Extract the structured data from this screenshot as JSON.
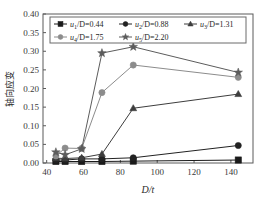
{
  "chart_data": {
    "type": "line",
    "title": "",
    "xlabel": "D/t",
    "ylabel": "轴向应变",
    "xlim": [
      38,
      152
    ],
    "ylim": [
      0.0,
      0.4
    ],
    "xticks": [
      40,
      60,
      80,
      100,
      120,
      140
    ],
    "yticks": [
      "0.00",
      "0.05",
      "0.10",
      "0.15",
      "0.20",
      "0.25",
      "0.30",
      "0.35",
      "0.40"
    ],
    "ytick_values": [
      0.0,
      0.05,
      0.1,
      0.15,
      0.2,
      0.25,
      0.3,
      0.35,
      0.4
    ],
    "grid": false,
    "legend_position": "top-inside",
    "x": [
      45,
      50,
      59,
      70,
      87,
      144
    ],
    "series": [
      {
        "name": "u1/D=0.44",
        "label_base": "u",
        "label_sub": "1",
        "label_rest": "/D=0.44",
        "marker": "square",
        "color": "#1a1a1a",
        "values": [
          0.004,
          0.004,
          0.004,
          0.004,
          0.005,
          0.008
        ]
      },
      {
        "name": "u2/D=0.88",
        "label_base": "u",
        "label_sub": "2",
        "label_rest": "/D=0.88",
        "marker": "circle",
        "color": "#222222",
        "values": [
          0.008,
          0.008,
          0.011,
          0.011,
          0.014,
          0.047
        ]
      },
      {
        "name": "u3/D=1.31",
        "label_base": "u",
        "label_sub": "3",
        "label_rest": "/D=1.31",
        "marker": "triangle",
        "color": "#3d3d3d",
        "values": [
          0.013,
          0.012,
          0.014,
          0.024,
          0.147,
          0.185
        ]
      },
      {
        "name": "u4/D=1.75",
        "label_base": "u",
        "label_sub": "4",
        "label_rest": "/D=1.75",
        "marker": "circle",
        "color": "#8c8c8c",
        "values": [
          0.019,
          0.04,
          0.039,
          0.189,
          0.263,
          0.23
        ]
      },
      {
        "name": "u5/D=2.20",
        "label_base": "u",
        "label_sub": "5",
        "label_rest": "/D=2.20",
        "marker": "star",
        "color": "#5c5c5c",
        "values": [
          0.029,
          0.022,
          0.038,
          0.295,
          0.312,
          0.243
        ]
      }
    ]
  }
}
